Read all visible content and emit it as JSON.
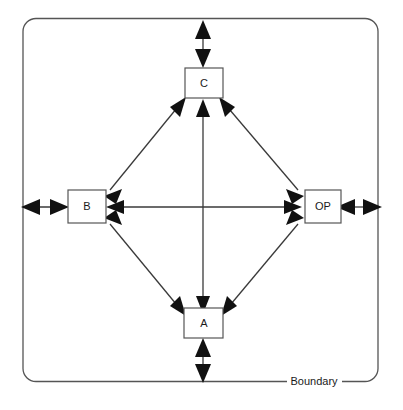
{
  "diagram": {
    "boundary": {
      "label": "Boundary",
      "shape": "rounded-rectangle",
      "stroke_color": "#555555"
    },
    "nodes": [
      {
        "id": "C",
        "label": "C",
        "position": "top",
        "cx": 203,
        "cy": 83,
        "w": 38,
        "h": 30
      },
      {
        "id": "B",
        "label": "B",
        "position": "left",
        "cx": 86,
        "cy": 207,
        "w": 38,
        "h": 33
      },
      {
        "id": "OP",
        "label": "OP",
        "position": "right",
        "cx": 322,
        "cy": 207,
        "w": 36,
        "h": 33
      },
      {
        "id": "A",
        "label": "A",
        "position": "bottom",
        "cx": 203,
        "cy": 323,
        "w": 39,
        "h": 30
      }
    ],
    "internal_links": [
      {
        "from": "B",
        "to": "C",
        "style": "double-headed"
      },
      {
        "from": "C",
        "to": "OP",
        "style": "double-headed"
      },
      {
        "from": "OP",
        "to": "A",
        "style": "double-headed"
      },
      {
        "from": "A",
        "to": "B",
        "style": "double-headed"
      },
      {
        "from": "B",
        "to": "OP",
        "style": "double-headed"
      },
      {
        "from": "C",
        "to": "A",
        "style": "double-headed"
      }
    ],
    "external_links": [
      {
        "node": "C",
        "direction": "up",
        "style": "double-headed"
      },
      {
        "node": "B",
        "direction": "left",
        "style": "double-headed"
      },
      {
        "node": "OP",
        "direction": "right",
        "style": "double-headed"
      },
      {
        "node": "A",
        "direction": "down",
        "style": "double-headed"
      }
    ],
    "colors": {
      "background": "#ffffff",
      "line": "#3a3a3a",
      "arrow": "#111111",
      "box_stroke": "#555555",
      "text": "#1a1a1a"
    }
  }
}
